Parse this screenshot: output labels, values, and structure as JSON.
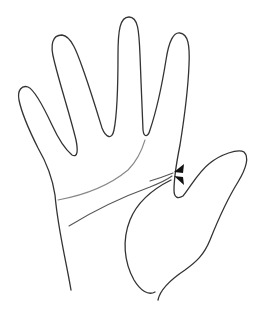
{
  "figure": {
    "colors": {
      "background": "#ffffff",
      "outline": "#333333",
      "palm_line": "#555555",
      "palm_line_light": "#888888",
      "arrow": "#111111"
    },
    "markers": [
      {
        "name": "arrow-up-left",
        "x": 178,
        "y": 170
      },
      {
        "name": "arrow-down-left",
        "x": 178,
        "y": 178
      }
    ]
  }
}
